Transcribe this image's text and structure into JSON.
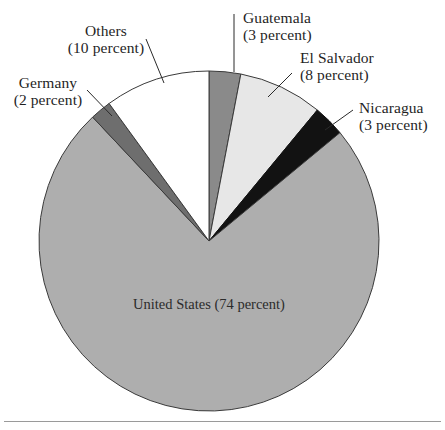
{
  "chart_data": {
    "type": "pie",
    "title": "",
    "unit": "percent",
    "categories": [
      "Guatemala",
      "El Salvador",
      "Nicaragua",
      "United States",
      "Germany",
      "Others"
    ],
    "values": [
      3,
      8,
      3,
      74,
      2,
      10
    ],
    "start_angle_deg": 0,
    "direction": "clockwise",
    "legend": "none",
    "slices": [
      {
        "label": "Guatemala",
        "value": 3,
        "value_text": "(3 percent)",
        "color": "#8a8a8a",
        "stroke": "#3a3a3a"
      },
      {
        "label": "El Salvador",
        "value": 8,
        "value_text": "(8 percent)",
        "color": "#e7e7e7",
        "stroke": "#3a3a3a"
      },
      {
        "label": "Nicaragua",
        "value": 3,
        "value_text": "(3 percent)",
        "color": "#121212",
        "stroke": "#121212"
      },
      {
        "label": "United States",
        "value": 74,
        "value_text": "(74 percent)",
        "color": "#aeaeae",
        "stroke": "#3a3a3a"
      },
      {
        "label": "Germany",
        "value": 2,
        "value_text": "(2 percent)",
        "color": "#6e6e6e",
        "stroke": "#3a3a3a"
      },
      {
        "label": "Others",
        "value": 10,
        "value_text": "(10 percent)",
        "color": "#ffffff",
        "stroke": "#3a3a3a"
      }
    ],
    "geometry": {
      "cx": 209,
      "cy": 241,
      "r": 170
    }
  },
  "labels": {
    "others": {
      "name": "Others",
      "pct": "(10 percent)"
    },
    "germany": {
      "name": "Germany",
      "pct": "(2 percent)"
    },
    "guatemala": {
      "name": "Guatemala",
      "pct": "(3 percent)"
    },
    "el_salvador": {
      "name": "El Salvador",
      "pct": "(8 percent)"
    },
    "nicaragua": {
      "name": "Nicaragua",
      "pct": "(3 percent)"
    },
    "united_states": {
      "name": "United States",
      "pct": "(74 percent)"
    }
  }
}
